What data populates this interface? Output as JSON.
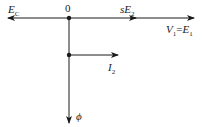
{
  "diagram": {
    "type": "phasor-diagram",
    "origin_label": "0",
    "labels": {
      "ec": {
        "main": "E",
        "sub": "C"
      },
      "se2": {
        "main": "sE",
        "sub": "2"
      },
      "v1e1": {
        "a": "V",
        "a_sub": "1",
        "eq": "=",
        "b": "E",
        "b_sub": "1"
      },
      "i2": {
        "main": "I",
        "sub": "2"
      },
      "phi": "ϕ"
    },
    "colors": {
      "line": "#1a1a1a",
      "background": "#ffffff"
    }
  }
}
